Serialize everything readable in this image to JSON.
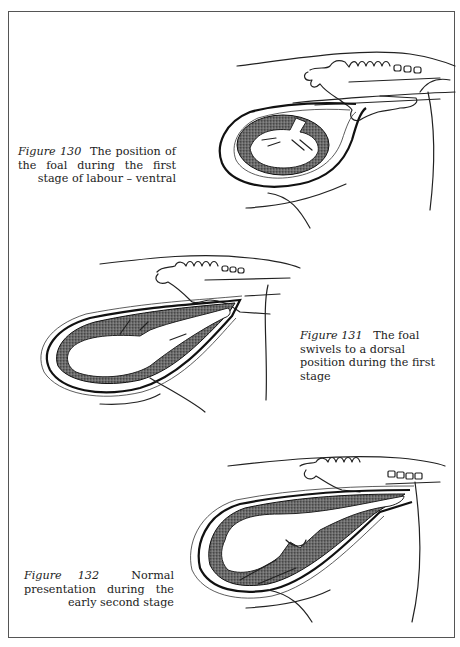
{
  "figures": [
    {
      "number": "Figure 130",
      "caption": "The position of the foal during the first stage of labour – ventral"
    },
    {
      "number": "Figure 131",
      "caption": "The foal swivels to a dorsal position during the first stage"
    },
    {
      "number": "Figure 132",
      "caption": "Normal presentation during the early second stage"
    }
  ]
}
